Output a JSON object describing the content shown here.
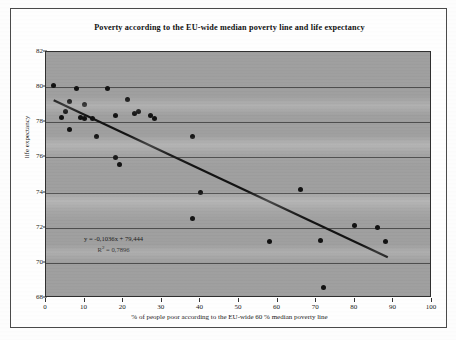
{
  "figure": {
    "title": "Poverty according to the EU-wide median poverty line and life expectancy"
  },
  "annotations": {
    "equation": "y = -0,1036x + 79,444",
    "r_squared_prefix": "R",
    "r_squared_sup": "2",
    "r_squared_value": " = 0,7896"
  },
  "chart_data": {
    "type": "scatter",
    "title": "Poverty according to the EU-wide median poverty line and life expectancy",
    "xlabel": "% of people poor according to the EU-wide 60 % median poverty line",
    "ylabel": "life expectancy",
    "xlim": [
      0,
      100
    ],
    "ylim": [
      68,
      82
    ],
    "xticks": [
      0,
      10,
      20,
      30,
      40,
      50,
      60,
      70,
      80,
      90,
      100
    ],
    "yticks": [
      68,
      70,
      72,
      74,
      76,
      78,
      80,
      82
    ],
    "grid": "horizontal",
    "legend": "none",
    "marker_color": "#101010",
    "trendline": {
      "type": "linear",
      "equation": "y = -0,1036x + 79,444",
      "slope": -0.1036,
      "intercept": 79.444,
      "r_squared": 0.7896,
      "x_start": 2,
      "x_end": 89,
      "color": "#111111"
    },
    "points": [
      {
        "x": 2,
        "y": 80.1
      },
      {
        "x": 4,
        "y": 78.3
      },
      {
        "x": 5,
        "y": 78.6
      },
      {
        "x": 6,
        "y": 79.2
      },
      {
        "x": 6,
        "y": 77.6
      },
      {
        "x": 8,
        "y": 79.9
      },
      {
        "x": 9,
        "y": 78.3
      },
      {
        "x": 10,
        "y": 79.0
      },
      {
        "x": 10,
        "y": 78.2
      },
      {
        "x": 12,
        "y": 78.2
      },
      {
        "x": 13,
        "y": 77.2
      },
      {
        "x": 16,
        "y": 79.9
      },
      {
        "x": 18,
        "y": 78.4
      },
      {
        "x": 18,
        "y": 76.0
      },
      {
        "x": 19,
        "y": 75.6
      },
      {
        "x": 21,
        "y": 79.3
      },
      {
        "x": 23,
        "y": 78.5
      },
      {
        "x": 24,
        "y": 78.6
      },
      {
        "x": 27,
        "y": 78.4
      },
      {
        "x": 28,
        "y": 78.2
      },
      {
        "x": 38,
        "y": 77.2
      },
      {
        "x": 38,
        "y": 72.5
      },
      {
        "x": 40,
        "y": 74.0
      },
      {
        "x": 58,
        "y": 71.2
      },
      {
        "x": 66,
        "y": 74.2
      },
      {
        "x": 71,
        "y": 71.3
      },
      {
        "x": 72,
        "y": 68.6
      },
      {
        "x": 80,
        "y": 72.1
      },
      {
        "x": 86,
        "y": 72.0
      },
      {
        "x": 88,
        "y": 71.2
      }
    ]
  }
}
